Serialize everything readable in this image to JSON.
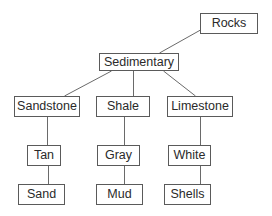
{
  "diagram": {
    "type": "tree",
    "title": "",
    "nodes": {
      "rocks": {
        "label": "Rocks",
        "x": 200,
        "y": 13,
        "w": 58,
        "h": 21
      },
      "sedimentary": {
        "label": "Sedimentary",
        "x": 99,
        "y": 53,
        "w": 80,
        "h": 18
      },
      "sandstone": {
        "label": "Sandstone",
        "x": 14,
        "y": 96,
        "w": 66,
        "h": 21
      },
      "shale": {
        "label": "Shale",
        "x": 96,
        "y": 96,
        "w": 54,
        "h": 21
      },
      "limestone": {
        "label": "Limestone",
        "x": 167,
        "y": 96,
        "w": 66,
        "h": 21
      },
      "tan": {
        "label": "Tan",
        "x": 27,
        "y": 145,
        "w": 34,
        "h": 21
      },
      "gray": {
        "label": "Gray",
        "x": 97,
        "y": 145,
        "w": 43,
        "h": 21
      },
      "white": {
        "label": "White",
        "x": 168,
        "y": 145,
        "w": 43,
        "h": 21
      },
      "sand": {
        "label": "Sand",
        "x": 18,
        "y": 184,
        "w": 47,
        "h": 21
      },
      "mud": {
        "label": "Mud",
        "x": 96,
        "y": 184,
        "w": 47,
        "h": 21
      },
      "shells": {
        "label": "Shells",
        "x": 164,
        "y": 184,
        "w": 47,
        "h": 21
      }
    },
    "edges": [
      {
        "from": "rocks",
        "to": "sedimentary",
        "x1": 200,
        "y1": 30,
        "x2": 159,
        "y2": 53
      },
      {
        "from": "sedimentary",
        "to": "sandstone",
        "x1": 111,
        "y1": 71,
        "x2": 64,
        "y2": 96
      },
      {
        "from": "sedimentary",
        "to": "shale",
        "x1": 133,
        "y1": 71,
        "x2": 133,
        "y2": 96
      },
      {
        "from": "sedimentary",
        "to": "limestone",
        "x1": 163,
        "y1": 71,
        "x2": 195,
        "y2": 96
      },
      {
        "from": "sandstone",
        "to": "tan",
        "x1": 47,
        "y1": 117,
        "x2": 47,
        "y2": 145
      },
      {
        "from": "tan",
        "to": "sand",
        "x1": 48,
        "y1": 166,
        "x2": 48,
        "y2": 184
      },
      {
        "from": "shale",
        "to": "gray",
        "x1": 124,
        "y1": 117,
        "x2": 124,
        "y2": 145
      },
      {
        "from": "gray",
        "to": "mud",
        "x1": 124,
        "y1": 166,
        "x2": 124,
        "y2": 184
      },
      {
        "from": "limestone",
        "to": "white",
        "x1": 200,
        "y1": 117,
        "x2": 200,
        "y2": 145
      },
      {
        "from": "white",
        "to": "shells",
        "x1": 200,
        "y1": 166,
        "x2": 200,
        "y2": 184
      }
    ],
    "colors": {
      "border": "#5a5a5a",
      "line": "#6a6a6a",
      "text": "#2a2a2a",
      "background": "#ffffff"
    }
  }
}
